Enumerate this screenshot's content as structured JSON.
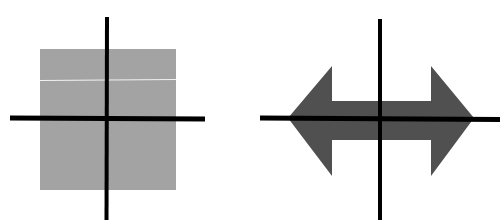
{
  "figure": {
    "panels": [
      {
        "name": "square-with-axes",
        "shape": "square",
        "fill": "#a3a3a3",
        "stripe_color": "#f2f2f2",
        "axis_color": "#000000"
      },
      {
        "name": "double-arrow-with-axes",
        "shape": "double-headed horizontal arrow",
        "fill": "#505050",
        "axis_color": "#000000"
      }
    ]
  }
}
